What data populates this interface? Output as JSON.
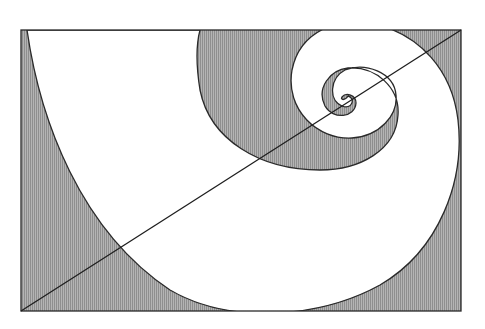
{
  "diagram": {
    "type": "golden-spiral-in-rectangle",
    "title": "",
    "colors": {
      "background": "#ffffff",
      "hatch_fill": "#a8a8a8",
      "hatch_line": "#7a7a7a",
      "stroke": "#2a2a2a",
      "white_band": "#ffffff"
    },
    "rectangle": {
      "x": 21,
      "y": 30,
      "width": 440,
      "height": 281
    },
    "diagonal": {
      "x1": 21,
      "y1": 311,
      "x2": 461,
      "y2": 30
    },
    "spiral_center": {
      "x": 340,
      "y": 103
    },
    "regions": [
      {
        "name": "white-spiral-band",
        "fill": "white"
      },
      {
        "name": "shaded-background",
        "fill": "vertical hatch gray"
      }
    ]
  }
}
